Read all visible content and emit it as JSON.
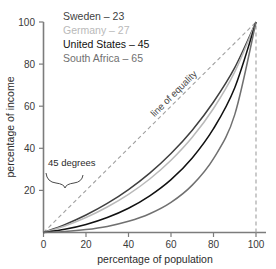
{
  "chart_data": {
    "type": "line",
    "title": "",
    "xlabel": "percentage of population",
    "ylabel": "percentage of income",
    "xlim": [
      0,
      100
    ],
    "ylim": [
      0,
      100
    ],
    "xticks": [
      "0",
      "20",
      "40",
      "60",
      "80",
      "100"
    ],
    "yticks": [
      "20",
      "40",
      "60",
      "80",
      "100"
    ],
    "grid": false,
    "legend_position": "top-left-inside",
    "annotations": [
      {
        "name": "line-of-equality",
        "text": "line of equality"
      },
      {
        "name": "forty-five-degrees",
        "text": "45 degrees"
      }
    ],
    "reference_line": {
      "name": "line of equality",
      "style": "dashed",
      "from": [
        0,
        0
      ],
      "to": [
        100,
        100
      ],
      "color": "#9a9a9a"
    },
    "vertical_reference": {
      "name": "x-100-dashed",
      "style": "dashed",
      "x": 100,
      "color": "#9a9a9a"
    },
    "series": [
      {
        "name": "Sweden",
        "gini": 23,
        "legend_label": "Sweden – 23",
        "color": "#3f3f3f",
        "x": [
          0,
          10,
          20,
          30,
          40,
          50,
          60,
          70,
          80,
          90,
          100
        ],
        "values": [
          0,
          3.7,
          8.3,
          13.8,
          20.4,
          28.2,
          37.5,
          48.6,
          62.0,
          78.3,
          100
        ]
      },
      {
        "name": "Germany",
        "gini": 27,
        "legend_label": "Germany – 27",
        "color": "#b9b9b9",
        "x": [
          0,
          10,
          20,
          30,
          40,
          50,
          60,
          70,
          80,
          90,
          100
        ],
        "values": [
          0,
          3.1,
          7.1,
          12.1,
          18.1,
          25.4,
          34.3,
          45.2,
          58.9,
          76.3,
          100
        ]
      },
      {
        "name": "United States",
        "gini": 45,
        "legend_label": "United States – 45",
        "color": "#111111",
        "x": [
          0,
          10,
          20,
          30,
          40,
          50,
          60,
          70,
          80,
          90,
          100
        ],
        "values": [
          0,
          1.5,
          3.8,
          7.1,
          11.5,
          17.4,
          25.1,
          35.4,
          49.3,
          68.8,
          100
        ]
      },
      {
        "name": "South Africa",
        "gini": 65,
        "legend_label": "South Africa – 65",
        "color": "#707070",
        "x": [
          0,
          10,
          20,
          30,
          40,
          50,
          60,
          70,
          80,
          90,
          100
        ],
        "values": [
          0,
          0.5,
          1.4,
          2.9,
          5.3,
          8.9,
          14.3,
          22.5,
          35.1,
          56.0,
          100
        ]
      }
    ]
  },
  "axes": {
    "x_title": "percentage of population",
    "y_title": "percentage of income",
    "x_ticks": [
      "0",
      "20",
      "40",
      "60",
      "80",
      "100"
    ],
    "y_ticks": [
      "20",
      "40",
      "60",
      "80",
      "100"
    ]
  },
  "legend": {
    "items": [
      {
        "label": "Sweden – 23",
        "color": "#3f3f3f"
      },
      {
        "label": "Germany – 27",
        "color": "#b9b9b9"
      },
      {
        "label": "United States – 45",
        "color": "#111111"
      },
      {
        "label": "South Africa – 65",
        "color": "#707070"
      }
    ]
  },
  "annotations": {
    "equality": "line of equality",
    "degrees": "45 degrees"
  },
  "colors": {
    "axis": "#7c7c7c",
    "dashed": "#a0a0a0",
    "text": "#2b2b2b",
    "background": "#ffffff"
  }
}
